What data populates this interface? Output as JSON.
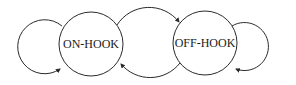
{
  "diagram": {
    "type": "state-transition",
    "states": [
      {
        "id": "on-hook",
        "label": "ON-HOOK"
      },
      {
        "id": "off-hook",
        "label": "OFF-HOOK"
      }
    ],
    "transitions": [
      {
        "from": "on-hook",
        "to": "on-hook",
        "kind": "self-loop"
      },
      {
        "from": "on-hook",
        "to": "off-hook",
        "kind": "arc-top"
      },
      {
        "from": "off-hook",
        "to": "on-hook",
        "kind": "arc-bottom"
      },
      {
        "from": "off-hook",
        "to": "off-hook",
        "kind": "self-loop"
      }
    ],
    "colors": {
      "stroke": "#2a2a2a",
      "background": "#ffffff"
    }
  }
}
